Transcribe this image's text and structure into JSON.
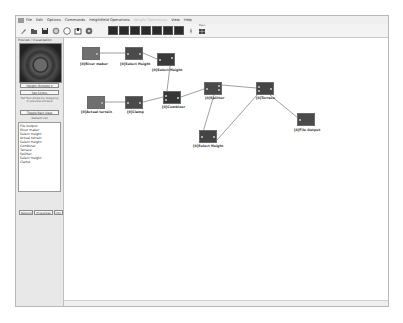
{
  "menu": {
    "items": [
      "File",
      "Edit",
      "Options",
      "Commands",
      "Heightfield Operations",
      "Weight Operations",
      "View",
      "Help"
    ],
    "disabled": [
      false,
      false,
      false,
      false,
      false,
      true,
      false,
      false
    ]
  },
  "toolbar": {
    "buttons": [
      "new-icon",
      "open-icon",
      "save-icon",
      "sphere-icon",
      "circle-icon",
      "export-icon",
      "settings-icon"
    ],
    "generator_buttons": [
      "terrain-gen-1",
      "terrain-gen-2",
      "terrain-gen-3",
      "terrain-gen-4",
      "terrain-gen-5",
      "terrain-gen-6",
      "terrain-gen-7"
    ],
    "extra_label": "Base"
  },
  "left_panel": {
    "title": "Preview / Visualization",
    "height_dropdown": "Height (Simple)",
    "set_colors_button": "Set Colors",
    "note": "Set Sun Angle by dragging in preview window",
    "toggle_button": "Toggle Rain View",
    "default_list_label": "Default List",
    "node_list": [
      "File Output",
      "River maker",
      "Select Height",
      "Actual terrain",
      "Select Height",
      "Combiner",
      "Terrace",
      "Splitter",
      "Select Height",
      "Clamp"
    ],
    "bottom_buttons": [
      "Rebuild",
      "Properties",
      "Info"
    ]
  },
  "nodes": [
    {
      "id": "river-maker",
      "label": "[0]River maker",
      "color": "#6f6f6f"
    },
    {
      "id": "select-height-1",
      "label": "[0]Select Height",
      "color": "#4a4a4a"
    },
    {
      "id": "select-height-2",
      "label": "[0]Select Height",
      "color": "#3a3a3a"
    },
    {
      "id": "actual-terrain",
      "label": "[0]Actual terrain",
      "color": "#6f6f6f"
    },
    {
      "id": "clamp",
      "label": "[0]Clamp",
      "color": "#4a4a4a"
    },
    {
      "id": "combiner",
      "label": "[0]Combiner",
      "color": "#363636"
    },
    {
      "id": "splitter",
      "label": "[0]Splitter",
      "color": "#4a4a4a"
    },
    {
      "id": "terrace",
      "label": "[0]Terrace",
      "color": "#454545"
    },
    {
      "id": "select-height-3",
      "label": "[0]Select Height",
      "color": "#444444"
    },
    {
      "id": "file-output",
      "label": "[0]File Output",
      "color": "#4a4a4a"
    }
  ]
}
